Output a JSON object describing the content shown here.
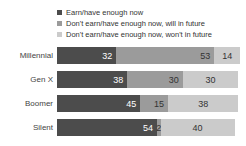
{
  "chart_data": {
    "type": "bar",
    "subtype": "horizontal-stacked",
    "title": "",
    "xlabel": "",
    "ylabel": "",
    "xlim": [
      0,
      100
    ],
    "grid": false,
    "legend_position": "top",
    "categories": [
      "Millennial",
      "Gen X",
      "Boomer",
      "Silent"
    ],
    "series": [
      {
        "name": "Earn/have enough now",
        "color": "#4c4c4c",
        "value_text_color": "#ffffff",
        "values": [
          32,
          38,
          45,
          54
        ]
      },
      {
        "name": "Don't earn/have enough now, will in future",
        "color": "#9b9b9b",
        "value_text_color": "#333333",
        "values": [
          53,
          30,
          15,
          2
        ]
      },
      {
        "name": "Don't earn/have enough now, won't in future",
        "color": "#cbcbcb",
        "value_text_color": "#333333",
        "values": [
          14,
          30,
          38,
          40
        ]
      }
    ]
  },
  "layout_colors": {
    "background": "#ffffff",
    "category_label": "#444444",
    "legend_label": "#333333"
  }
}
